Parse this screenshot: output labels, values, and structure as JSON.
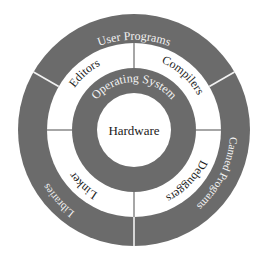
{
  "diagram": {
    "type": "concentric-rings",
    "center": {
      "x": 134,
      "y": 130
    },
    "colors": {
      "ring_fill": "#6b6b6b",
      "white": "#ffffff",
      "divider_light": "#f2f2f2",
      "divider_dark": "#6b6b6b",
      "text_dark": "#1a1a1a",
      "text_light": "#f4f4f4"
    },
    "core": {
      "label": "Hardware"
    },
    "os_ring": {
      "label": "Operating System"
    },
    "middle_ring": {
      "segments": [
        {
          "label": "Editors",
          "position": "top-left"
        },
        {
          "label": "Compilers",
          "position": "top-right"
        },
        {
          "label": "Debuggers",
          "position": "bottom-right"
        },
        {
          "label": "Linker",
          "position": "bottom-left"
        }
      ]
    },
    "outer_ring": {
      "segments": [
        {
          "label": "User Programs",
          "position": "top"
        },
        {
          "label": "Canned Programs",
          "position": "right"
        },
        {
          "label": "Libraries",
          "position": "left"
        }
      ]
    }
  }
}
